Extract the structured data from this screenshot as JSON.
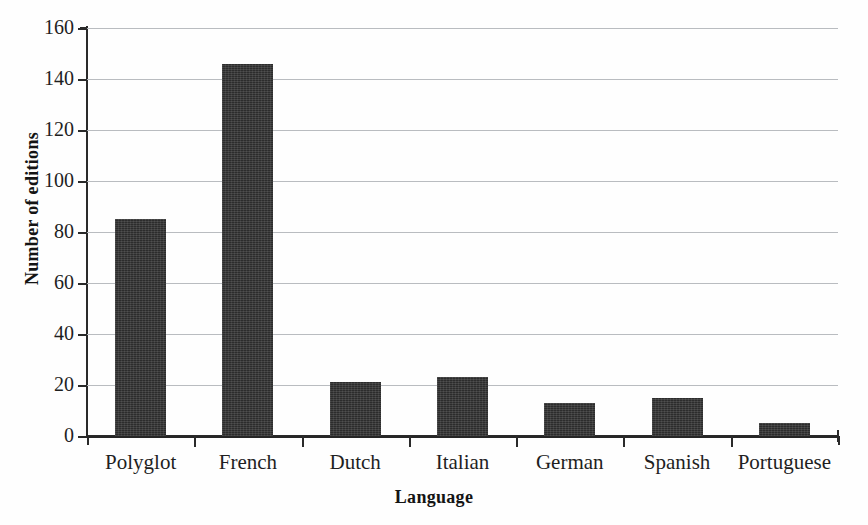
{
  "chart_data": {
    "type": "bar",
    "title": "",
    "xlabel": "Language",
    "ylabel": "Number of editions",
    "categories": [
      "Polyglot",
      "French",
      "Dutch",
      "Italian",
      "German",
      "Spanish",
      "Portuguese"
    ],
    "values": [
      85,
      146,
      21,
      23,
      13,
      15,
      5
    ],
    "ylim": [
      0,
      160
    ],
    "yticks": [
      0,
      20,
      40,
      60,
      80,
      100,
      120,
      140,
      160
    ],
    "ytick_labels": [
      "0",
      "20",
      "40",
      "60",
      "80",
      "100",
      "120",
      "140",
      "160"
    ],
    "grid": true,
    "grid_axis": "y",
    "legend": false,
    "bar_color": "#2c2c2c",
    "grid_color": "#b9bcc0",
    "axis_color": "#2a2a2a",
    "background_color": "#fefefe"
  }
}
